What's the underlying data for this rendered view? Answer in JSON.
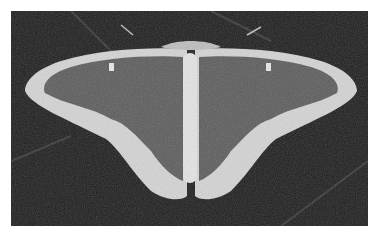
{
  "image": {
    "subject": "moth with wings spread",
    "description": "Grayscale photograph of a moth with wings fully spread, resting on a dark textured surface",
    "colors": {
      "background": "#1e1e1e",
      "wing_fill": "#5c5c5c",
      "wing_border": "#d8d8d8",
      "body": "#e4e4e4",
      "frame": "#ffffff"
    }
  }
}
